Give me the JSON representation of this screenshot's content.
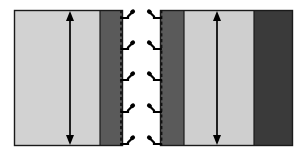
{
  "figure": {
    "name": "two-panel-layer-cross-section-diagram",
    "width": 307,
    "height": 159,
    "background_color": "#ffffff"
  },
  "colors": {
    "background": "#ffffff",
    "light_layer": "#d2d2d2",
    "light_layer_right": "#cfcfcf",
    "mid_dark_layer": "#5a5a5a",
    "dark_layer": "#3a3a3a",
    "outline": "#1a1a1a",
    "dashed_line": "#111111",
    "arrow": "#000000",
    "hook": "#000000"
  },
  "panels": [
    {
      "id": "panel-left",
      "label": "left-cross-section",
      "frame": {
        "x": 14,
        "y": 10,
        "width": 109,
        "height": 136
      },
      "layers": [
        {
          "name": "light-substrate",
          "x": 14,
          "width": 86,
          "fill": "#d2d2d2"
        },
        {
          "name": "dark-coating",
          "x": 100,
          "width": 23,
          "fill": "#5a5a5a"
        }
      ],
      "dashed_interface": {
        "name": "right-edge-dashed-interface",
        "x": 121,
        "y_top": 10,
        "y_bottom": 146
      },
      "arrow": {
        "name": "thickness-arrow",
        "x": 70,
        "y_top": 14,
        "y_bottom": 142,
        "style": "double-headed-vertical"
      },
      "hooks": {
        "name": "anchor-hooks",
        "count": 5,
        "side": "right",
        "y_positions": [
          13,
          44,
          75,
          107,
          139
        ]
      }
    },
    {
      "id": "panel-right",
      "label": "right-cross-section",
      "frame": {
        "x": 160,
        "y": 10,
        "width": 133,
        "height": 136
      },
      "layers": [
        {
          "name": "dark-coating",
          "x": 160,
          "width": 24,
          "fill": "#5a5a5a"
        },
        {
          "name": "light-substrate",
          "x": 184,
          "width": 70,
          "fill": "#cfcfcf"
        },
        {
          "name": "dark-coating-outer",
          "x": 254,
          "width": 39,
          "fill": "#3a3a3a"
        }
      ],
      "dashed_interface": {
        "name": "left-edge-dashed-interface",
        "x": 161,
        "y_top": 10,
        "y_bottom": 146
      },
      "arrow": {
        "name": "thickness-arrow",
        "x": 217,
        "y_top": 14,
        "y_bottom": 142,
        "style": "double-headed-vertical"
      },
      "hooks": {
        "name": "anchor-hooks",
        "count": 5,
        "side": "left",
        "y_positions": [
          13,
          44,
          75,
          107,
          139
        ]
      }
    }
  ],
  "chart_data": {
    "type": "diagram",
    "title": "",
    "xlabel": "",
    "ylabel": "",
    "annotations": [],
    "series": [
      {
        "name": "left-panel-layer-widths",
        "categories": [
          "light-substrate",
          "dark-coating"
        ],
        "values": [
          86,
          23
        ]
      },
      {
        "name": "right-panel-layer-widths",
        "categories": [
          "dark-coating",
          "light-substrate",
          "dark-coating-outer"
        ],
        "values": [
          24,
          70,
          39
        ]
      }
    ]
  }
}
